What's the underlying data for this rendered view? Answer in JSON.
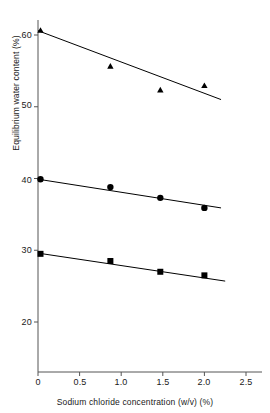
{
  "chart_data": {
    "type": "scatter",
    "title": "",
    "subtitle": "",
    "xlabel": "Sodium chloride concentration (w/v) (%)",
    "ylabel": "Equilibrium water content (%)",
    "xlim": [
      0,
      2.5
    ],
    "ylim": [
      14,
      62
    ],
    "grid": false,
    "legend": "none",
    "xticks": [
      0,
      0.5,
      1.0,
      1.5,
      2.0,
      2.5
    ],
    "xtick_labels": [
      "0",
      "0.5",
      "1.0",
      "1.5",
      "2.0",
      "2.5"
    ],
    "yticks": [
      20,
      30,
      40,
      50,
      60
    ],
    "ytick_labels": [
      "20",
      "30",
      "40",
      "50",
      "60"
    ],
    "series": [
      {
        "name": "series-triangle",
        "marker": "triangle",
        "color": "#000000",
        "x": [
          0.03,
          0.87,
          1.47,
          2.0
        ],
        "y": [
          60.6,
          55.6,
          52.3,
          52.9
        ],
        "fit_line": {
          "x": [
            0.0,
            2.2
          ],
          "y": [
            60.6,
            51.0
          ]
        }
      },
      {
        "name": "series-circle",
        "marker": "circle",
        "color": "#000000",
        "x": [
          0.03,
          0.87,
          1.47,
          2.0
        ],
        "y": [
          39.9,
          38.8,
          37.3,
          35.9
        ],
        "fit_line": {
          "x": [
            0.0,
            2.2
          ],
          "y": [
            39.9,
            35.9
          ]
        }
      },
      {
        "name": "series-square",
        "marker": "square",
        "color": "#000000",
        "x": [
          0.03,
          0.87,
          1.47,
          2.0
        ],
        "y": [
          29.5,
          28.5,
          27.0,
          26.5
        ],
        "fit_line": {
          "x": [
            0.0,
            2.25
          ],
          "y": [
            29.6,
            25.7
          ]
        }
      }
    ]
  },
  "axes": {
    "x_title": "Sodium chloride concentration (w/v) (%)",
    "y_title": "Equilibrium water content (%)",
    "x_tick_labels": [
      "0",
      "0.5",
      "1.0",
      "1.5",
      "2.0",
      "2.5"
    ],
    "y_tick_labels": [
      "20",
      "30",
      "40",
      "50",
      "60"
    ],
    "axis_color": "#555555"
  }
}
